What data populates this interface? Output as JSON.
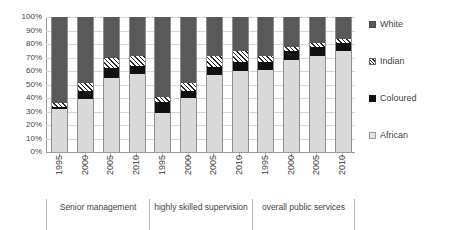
{
  "chart_data": {
    "type": "bar",
    "subtype": "stacked-100-percent",
    "title": "",
    "xlabel": "",
    "ylabel": "",
    "ylim": [
      0,
      100
    ],
    "y_tick_labels": [
      "100%",
      "90%",
      "80%",
      "70%",
      "60%",
      "50%",
      "40%",
      "30%",
      "20%",
      "10%",
      "0%"
    ],
    "grid": true,
    "legend_position": "right",
    "categories": [
      "1995",
      "2000",
      "2005",
      "2010",
      "1995",
      "2000",
      "2005",
      "2010",
      "1995",
      "2000",
      "2005",
      "2010"
    ],
    "groups": [
      {
        "label": "Senior management",
        "categories": [
          "1995",
          "2000",
          "2005",
          "2010"
        ]
      },
      {
        "label": "highly skilled supervision",
        "categories": [
          "1995",
          "2000",
          "2005",
          "2010"
        ]
      },
      {
        "label": "overall public services",
        "categories": [
          "1995",
          "2000",
          "2005",
          "2010"
        ]
      }
    ],
    "series": [
      {
        "name": "African",
        "color": "#d9d9d9",
        "values": [
          32,
          39,
          55,
          58,
          29,
          40,
          57,
          60,
          61,
          68,
          71,
          75
        ]
      },
      {
        "name": "Coloured",
        "color": "#111111",
        "values": [
          1,
          6,
          7,
          6,
          8,
          5,
          6,
          7,
          6,
          7,
          7,
          6
        ]
      },
      {
        "name": "Indian",
        "color": "#2b2b2b",
        "values": [
          3,
          6,
          8,
          7,
          4,
          6,
          8,
          8,
          4,
          3,
          3,
          3
        ]
      },
      {
        "name": "White",
        "color": "#595959",
        "values": [
          64,
          49,
          30,
          29,
          59,
          49,
          29,
          25,
          29,
          22,
          19,
          16
        ]
      }
    ]
  },
  "legend": {
    "items": [
      {
        "label": "White",
        "swatch": "white-swatch-icon"
      },
      {
        "label": "Indian",
        "swatch": "indian-swatch-icon"
      },
      {
        "label": "Coloured",
        "swatch": "coloured-swatch-icon"
      },
      {
        "label": "African",
        "swatch": "african-swatch-icon"
      }
    ]
  }
}
